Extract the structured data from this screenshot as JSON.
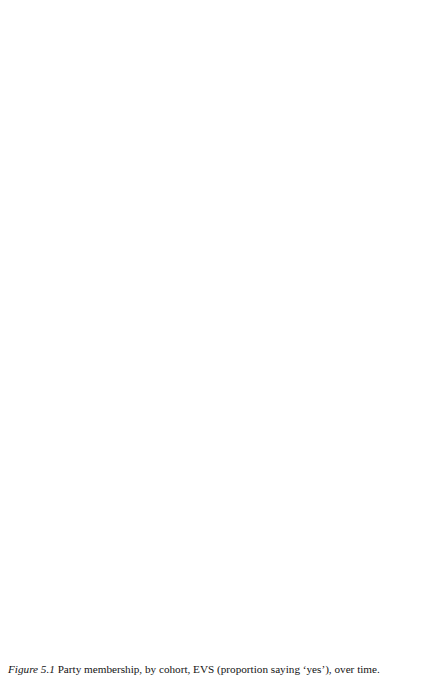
{
  "figure": {
    "caption_number": "Figure 5.1",
    "caption_text": "Party membership, by cohort, EVS (proportion saying ‘yes’), over time."
  },
  "legend": {
    "position": "bottom-center",
    "items": [
      {
        "label": "Pre-WWII",
        "style": "solid",
        "color": "#1a1a1a",
        "width": 1.8
      },
      {
        "label": "Post-WWII",
        "style": "solid",
        "color": "#4a4a4a",
        "width": 1.4
      },
      {
        "label": "Baby-boom",
        "style": "solid",
        "color": "#b4b4b4",
        "width": 1.3
      },
      {
        "label": "80s gen",
        "style": "dashed",
        "color": "#1a1a1a",
        "width": 1.8
      },
      {
        "label": "90s gen",
        "style": "dashed",
        "color": "#4a4a4a",
        "width": 1.4
      },
      {
        "label": "All",
        "style": "dashed",
        "color": "#b4b4b4",
        "width": 1.3
      }
    ]
  },
  "axes": {
    "x_ticks": [
      "1981",
      "1990",
      "1999"
    ],
    "y_ticks": [
      "0",
      "0.02",
      "0.04",
      "0.06",
      "0.08",
      "0.1",
      "0.12"
    ],
    "ylim": [
      0,
      0.12
    ],
    "xlim": [
      1981,
      1999
    ],
    "grid": true
  },
  "chart_data": {
    "type": "line",
    "title": "Party membership, by cohort, EVS (proportion saying ‘yes’), over time.",
    "xlabel": "",
    "ylabel": "",
    "x": [
      1981,
      1990,
      1999
    ],
    "ylim": [
      0,
      0.12
    ],
    "y_ticks": [
      0,
      0.02,
      0.04,
      0.06,
      0.08,
      0.1,
      0.12
    ],
    "legend_position": "bottom-center",
    "grid": true,
    "panels": [
      {
        "name": "Belgium",
        "series": [
          {
            "name": "Pre-WWII",
            "values": [
              0.043,
              0.047,
              0.085
            ]
          },
          {
            "name": "Post-WWII",
            "values": [
              0.035,
              0.066,
              0.084
            ]
          },
          {
            "name": "Baby-boom",
            "values": [
              0.023,
              0.052,
              0.083
            ]
          },
          {
            "name": "80s gen",
            "values": [
              0.002,
              0.04,
              0.06
            ]
          },
          {
            "name": "90s gen",
            "values": [
              null,
              0.008,
              0.043
            ]
          },
          {
            "name": "All",
            "values": [
              0.027,
              0.049,
              0.064
            ]
          }
        ]
      },
      {
        "name": "Denmark",
        "series": [
          {
            "name": "Pre-WWII",
            "values": [
              0.114,
              0.094,
              0.072
            ]
          },
          {
            "name": "Post-WWII",
            "values": [
              0.077,
              0.112,
              0.08
            ]
          },
          {
            "name": "Baby-boom",
            "values": [
              0.059,
              0.047,
              0.07
            ]
          },
          {
            "name": "80s gen",
            "values": [
              0.026,
              0.022,
              0.047
            ]
          },
          {
            "name": "90s gen",
            "values": [
              null,
              0.038,
              0.06
            ]
          },
          {
            "name": "All",
            "values": [
              0.067,
              0.067,
              0.068
            ]
          }
        ]
      },
      {
        "name": "Italy",
        "series": [
          {
            "name": "Pre-WWII",
            "values": [
              0.08,
              0.057,
              0.031
            ]
          },
          {
            "name": "Post-WWII",
            "values": [
              0.074,
              0.046,
              0.05
            ]
          },
          {
            "name": "Baby-boom",
            "values": [
              0.062,
              0.06,
              0.042
            ]
          },
          {
            "name": "80s gen",
            "values": [
              0.038,
              0.065,
              0.04
            ]
          },
          {
            "name": "90s gen",
            "values": [
              null,
              0.021,
              0.021
            ]
          },
          {
            "name": "All",
            "values": [
              0.063,
              0.054,
              0.044
            ]
          }
        ]
      },
      {
        "name": "Netherlands",
        "series": [
          {
            "name": "Pre-WWII",
            "values": [
              0.126,
              0.154,
              0.164
            ]
          },
          {
            "name": "Post-WWII",
            "values": [
              0.1,
              0.116,
              0.131
            ]
          },
          {
            "name": "Baby-boom",
            "values": [
              0.084,
              0.105,
              0.127
            ]
          },
          {
            "name": "80s gen",
            "values": [
              0.018,
              0.027,
              0.04
            ]
          },
          {
            "name": "90s gen",
            "values": [
              null,
              0.027,
              0.021
            ]
          },
          {
            "name": "All",
            "values": [
              0.086,
              0.098,
              0.1
            ]
          }
        ]
      },
      {
        "name": "France",
        "series": [
          {
            "name": "Pre-WWII",
            "values": [
              0.018,
              0.043,
              0.011
            ]
          },
          {
            "name": "Post-WWII",
            "values": [
              0.045,
              0.048,
              0.015
            ]
          },
          {
            "name": "Baby-boom",
            "values": [
              0.033,
              0.031,
              0.032
            ]
          },
          {
            "name": "80s gen",
            "values": [
              0.009,
              0.007,
              0.013
            ]
          },
          {
            "name": "90s gen",
            "values": [
              null,
              0.001,
              0.013
            ]
          },
          {
            "name": "All",
            "values": [
              0.027,
              0.026,
              0.013
            ]
          }
        ]
      },
      {
        "name": "Great Britain",
        "series": [
          {
            "name": "Pre-WWII",
            "values": [
              0.055,
              0.056,
              0.057
            ]
          },
          {
            "name": "Post-WWII",
            "values": [
              0.084,
              0.06,
              0.034
            ]
          },
          {
            "name": "Baby-boom",
            "values": [
              0.036,
              0.046,
              0.023
            ]
          },
          {
            "name": "80s gen",
            "values": [
              0.018,
              0.042,
              0.021
            ]
          },
          {
            "name": "90s gen",
            "values": [
              null,
              0.01,
              0.022
            ]
          },
          {
            "name": "All",
            "values": [
              0.046,
              0.048,
              0.024
            ]
          }
        ]
      }
    ]
  },
  "panel_layout": [
    {
      "name": "Belgium",
      "left": 8,
      "top": 22,
      "label_dx": 0,
      "label_dy": 0
    },
    {
      "name": "Denmark",
      "left": 221,
      "top": 22,
      "label_dx": 0,
      "label_dy": 0
    },
    {
      "name": "Italy",
      "left": 8,
      "top": 214,
      "label_dx": 0,
      "label_dy": 0
    },
    {
      "name": "Netherlands",
      "left": 221,
      "top": 214,
      "label_dx": 0,
      "label_dy": 68
    },
    {
      "name": "France",
      "left": 8,
      "top": 406,
      "label_dx": 0,
      "label_dy": 0
    },
    {
      "name": "Great Britain",
      "left": 221,
      "top": 406,
      "label_dx": 0,
      "label_dy": 0
    }
  ]
}
